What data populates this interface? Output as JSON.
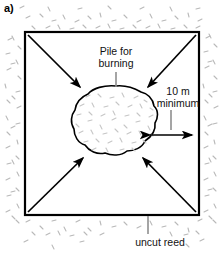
{
  "figure": {
    "panel_label": "a)",
    "title_internal": "Reed burning pile layout",
    "labels": {
      "pile_line1": "Pile for",
      "pile_line2": "burning",
      "dimension_line1": "10 m",
      "dimension_line2": "minimum",
      "uncut": "uncut reed"
    },
    "colors": {
      "ink": "#000000",
      "reed_texture": "#b9b9b9",
      "pile_texture": "#c8c8c8",
      "leader": "#8a8a8a",
      "background": "#ffffff"
    },
    "measurement": {
      "value": "10",
      "unit": "m",
      "qualifier": "minimum"
    },
    "elements": {
      "cut_area_shape": "square",
      "pile_shape": "irregular-blob",
      "arrow_count": 4,
      "dimension_arrow": "double-headed-horizontal"
    }
  }
}
